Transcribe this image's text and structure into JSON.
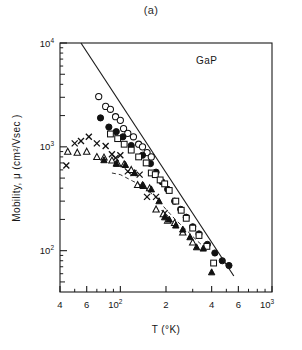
{
  "figure": {
    "panel_label": "(a)",
    "material_label": "GaP"
  },
  "chart_data": {
    "type": "scatter",
    "title": "(a)",
    "subtitle": "GaP",
    "xlabel": "T (°K)",
    "ylabel": "Mobility,  μ  (cm²/Vsec )",
    "xscale": "log",
    "yscale": "log",
    "xlim": [
      40,
      1000
    ],
    "ylim": [
      40,
      10000
    ],
    "grid": false,
    "legend": "none",
    "annotations": [
      {
        "text": "GaP",
        "x": 330,
        "y": 6000
      }
    ],
    "x_ticks_major": [
      {
        "value": 40,
        "label": "4"
      },
      {
        "value": 60,
        "label": "6"
      },
      {
        "value": 100,
        "label": "10",
        "sup": "2"
      },
      {
        "value": 200,
        "label": "2"
      },
      {
        "value": 400,
        "label": "4"
      },
      {
        "value": 600,
        "label": "6"
      },
      {
        "value": 1000,
        "label": "10",
        "sup": "3"
      }
    ],
    "x_ticks_minor": [
      50,
      70,
      80,
      90,
      300,
      500,
      700,
      800,
      900
    ],
    "y_ticks_major": [
      {
        "value": 100,
        "label": "10",
        "sup": "2"
      },
      {
        "value": 1000,
        "label": "10",
        "sup": "3"
      },
      {
        "value": 10000,
        "label": "10",
        "sup": "4"
      }
    ],
    "y_ticks_minor": [
      50,
      60,
      70,
      80,
      90,
      200,
      300,
      400,
      500,
      600,
      700,
      800,
      900,
      2000,
      3000,
      4000,
      5000,
      6000,
      7000,
      8000,
      9000
    ],
    "lines": [
      {
        "name": "theoretical-curve",
        "style": "solid",
        "points": [
          [
            55,
            10000
          ],
          [
            560,
            57
          ]
        ]
      },
      {
        "name": "guide-curve-dashed",
        "style": "dashed",
        "points": [
          [
            88,
            560
          ],
          [
            100,
            540
          ],
          [
            120,
            470
          ],
          [
            140,
            420
          ],
          [
            170,
            330
          ],
          [
            200,
            250
          ],
          [
            230,
            200
          ],
          [
            270,
            160
          ],
          [
            320,
            125
          ],
          [
            380,
            100
          ]
        ]
      }
    ],
    "series": [
      {
        "name": "open-circle",
        "marker": "circle-open",
        "points": [
          [
            72,
            3050
          ],
          [
            80,
            2450
          ],
          [
            86,
            2300
          ],
          [
            93,
            1950
          ],
          [
            100,
            1800
          ],
          [
            105,
            1500
          ],
          [
            112,
            1350
          ],
          [
            122,
            1250
          ],
          [
            132,
            1060
          ],
          [
            140,
            1000
          ],
          [
            150,
            880
          ],
          [
            160,
            800
          ]
        ]
      },
      {
        "name": "filled-circle",
        "marker": "circle-filled",
        "points": [
          [
            74,
            1900
          ],
          [
            84,
            1550
          ],
          [
            94,
            1400
          ],
          [
            104,
            1250
          ],
          [
            118,
            1030
          ],
          [
            140,
            830
          ],
          [
            158,
            690
          ],
          [
            172,
            570
          ],
          [
            188,
            460
          ],
          [
            205,
            390
          ],
          [
            228,
            300
          ],
          [
            250,
            250
          ],
          [
            272,
            210
          ],
          [
            300,
            170
          ],
          [
            330,
            145
          ],
          [
            375,
            115
          ],
          [
            420,
            95
          ],
          [
            470,
            80
          ],
          [
            520,
            72
          ]
        ]
      },
      {
        "name": "open-square",
        "marker": "square-open",
        "points": [
          [
            86,
            1330
          ],
          [
            96,
            1200
          ],
          [
            106,
            1060
          ],
          [
            118,
            930
          ],
          [
            132,
            800
          ],
          [
            148,
            700
          ],
          [
            160,
            560
          ],
          [
            170,
            540
          ],
          [
            183,
            480
          ],
          [
            196,
            440
          ],
          [
            210,
            380
          ],
          [
            232,
            300
          ],
          [
            252,
            245
          ],
          [
            272,
            205
          ],
          [
            300,
            165
          ],
          [
            330,
            140
          ],
          [
            372,
            110
          ],
          [
            412,
            76
          ]
        ]
      },
      {
        "name": "cross-x",
        "marker": "x",
        "points": [
          [
            44,
            660
          ],
          [
            50,
            1080
          ],
          [
            55,
            1140
          ],
          [
            62,
            1250
          ],
          [
            70,
            1080
          ],
          [
            80,
            1020
          ],
          [
            88,
            850
          ],
          [
            93,
            780
          ],
          [
            100,
            830
          ],
          [
            112,
            580
          ],
          [
            122,
            560
          ],
          [
            134,
            540
          ],
          [
            150,
            330
          ],
          [
            172,
            330
          ],
          [
            196,
            230
          ]
        ]
      },
      {
        "name": "open-triangle",
        "marker": "triangle-open",
        "points": [
          [
            45,
            900
          ],
          [
            52,
            880
          ],
          [
            60,
            900
          ],
          [
            70,
            800
          ],
          [
            78,
            790
          ],
          [
            88,
            740
          ],
          [
            96,
            690
          ],
          [
            106,
            680
          ],
          [
            118,
            600
          ],
          [
            130,
            430
          ],
          [
            142,
            420
          ],
          [
            156,
            400
          ],
          [
            172,
            250
          ],
          [
            192,
            225
          ],
          [
            205,
            195
          ],
          [
            228,
            185
          ],
          [
            258,
            150
          ],
          [
            300,
            120
          ]
        ]
      },
      {
        "name": "filled-triangle",
        "marker": "triangle-filled",
        "points": [
          [
            78,
            745
          ],
          [
            94,
            690
          ],
          [
            108,
            670
          ],
          [
            124,
            560
          ],
          [
            140,
            430
          ],
          [
            160,
            390
          ],
          [
            180,
            300
          ],
          [
            196,
            210
          ],
          [
            210,
            200
          ],
          [
            232,
            175
          ],
          [
            258,
            160
          ],
          [
            288,
            135
          ],
          [
            318,
            108
          ],
          [
            352,
            105
          ],
          [
            400,
            62
          ]
        ]
      }
    ]
  }
}
